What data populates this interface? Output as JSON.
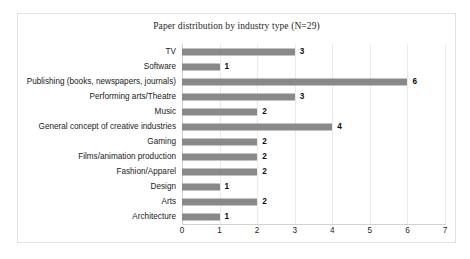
{
  "chart_data": {
    "type": "bar",
    "orientation": "horizontal",
    "title": "Paper distribution by industry type (N=29)",
    "xlabel": "",
    "ylabel": "",
    "xlim": [
      0,
      7
    ],
    "xticks": [
      0,
      1,
      2,
      3,
      4,
      5,
      6,
      7
    ],
    "grid": true,
    "grid_axis": "x",
    "legend": false,
    "bar_color": "#898989",
    "show_value_labels": true,
    "categories": [
      "TV",
      "Software",
      "Publishing (books, newspapers, journals)",
      "Performing arts/Theatre",
      "Music",
      "General concept of creative industries",
      "Gaming",
      "Films/animation production",
      "Fashion/Apparel",
      "Design",
      "Arts",
      "Architecture"
    ],
    "values": [
      3,
      1,
      6,
      3,
      2,
      4,
      2,
      2,
      2,
      1,
      2,
      1
    ],
    "value_labels": [
      "3",
      "1",
      "6",
      "3",
      "2",
      "4",
      "2",
      "2",
      "2",
      "1",
      "2",
      "1"
    ],
    "tick_labels": [
      "0",
      "1",
      "2",
      "3",
      "4",
      "5",
      "6",
      "7"
    ]
  },
  "frame": {
    "border_color": "#e2e2e2",
    "background": "#ffffff"
  }
}
